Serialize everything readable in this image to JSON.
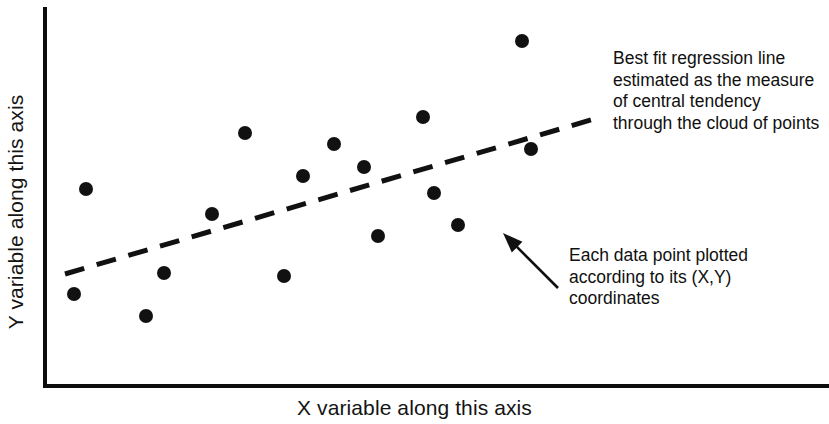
{
  "figure": {
    "background_color": "#ffffff",
    "ink_color": "#111111"
  },
  "axes": {
    "x_title": "X variable along this axis",
    "y_title": "Y variable along this axis"
  },
  "annotations": {
    "regression_line": "Best fit regression line estimated as the measure of central tendency through the cloud of points",
    "data_point": "Each data point plotted according to its (X,Y) coordinates"
  },
  "chart_data": {
    "type": "scatter",
    "title": "",
    "xlabel": "X variable along this axis",
    "ylabel": "Y variable along this axis",
    "xlim": [
      0,
      100
    ],
    "ylim": [
      0,
      100
    ],
    "grid": false,
    "legend": "none",
    "axis_ticks": {
      "x": [],
      "y": []
    },
    "marker": {
      "shape": "circle",
      "color": "#111111",
      "size_px": 14
    },
    "points": [
      {
        "x": 5.6,
        "y": 52.0,
        "px": 86,
        "py": 189
      },
      {
        "x": 4.1,
        "y": 24.1,
        "px": 74,
        "py": 294
      },
      {
        "x": 13.6,
        "y": 18.3,
        "px": 146,
        "py": 316
      },
      {
        "x": 16.0,
        "y": 29.7,
        "px": 164,
        "py": 273
      },
      {
        "x": 22.3,
        "y": 45.3,
        "px": 212,
        "py": 214
      },
      {
        "x": 26.6,
        "y": 66.8,
        "px": 245,
        "py": 133
      },
      {
        "x": 31.7,
        "y": 28.9,
        "px": 284,
        "py": 276
      },
      {
        "x": 34.2,
        "y": 55.5,
        "px": 303,
        "py": 176
      },
      {
        "x": 38.3,
        "y": 63.9,
        "px": 334,
        "py": 144
      },
      {
        "x": 42.2,
        "y": 57.8,
        "px": 364,
        "py": 167
      },
      {
        "x": 44.0,
        "y": 39.5,
        "px": 378,
        "py": 236
      },
      {
        "x": 49.9,
        "y": 71.1,
        "px": 423,
        "py": 117
      },
      {
        "x": 51.3,
        "y": 51.0,
        "px": 434,
        "py": 193
      },
      {
        "x": 54.7,
        "y": 42.6,
        "px": 458,
        "py": 225
      },
      {
        "x": 60.7,
        "y": 91.2,
        "px": 522,
        "py": 41
      },
      {
        "x": 61.8,
        "y": 63.0,
        "px": 531,
        "py": 149
      }
    ],
    "regression_line": {
      "label": "Best fit regression line",
      "style": "dashed",
      "color": "#111111",
      "start": {
        "px": 65,
        "py": 274
      },
      "end": {
        "px": 601,
        "py": 117
      }
    },
    "callout_arrow": {
      "label": "arrow pointing to a data point",
      "tail": {
        "px": 558,
        "py": 288
      },
      "tip": {
        "px": 503,
        "py": 233
      }
    }
  }
}
